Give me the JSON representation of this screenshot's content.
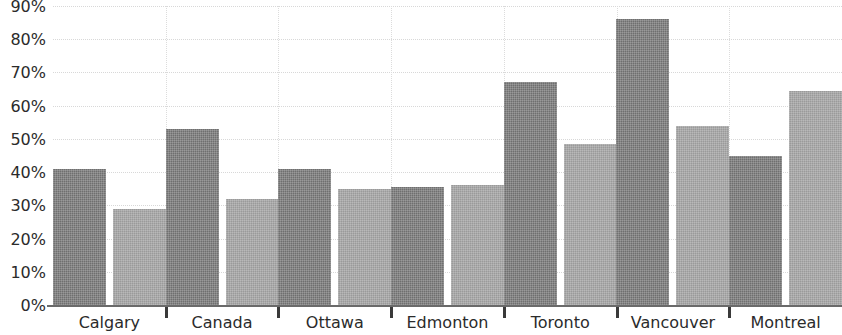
{
  "chart_data": {
    "type": "bar",
    "title": "",
    "subtitle": "",
    "xlabel": "",
    "ylabel": "",
    "categories": [
      "Calgary",
      "Canada",
      "Ottawa",
      "Edmonton",
      "Toronto",
      "Vancouver",
      "Montreal"
    ],
    "series": [
      {
        "name": "Series 1",
        "color": "#6f6f6f",
        "values": [
          41,
          53,
          41,
          35.5,
          67,
          86,
          45
        ]
      },
      {
        "name": "Series 2",
        "color": "#9a9a9a",
        "values": [
          29,
          32,
          35,
          36,
          48.5,
          54,
          64.5
        ]
      }
    ],
    "ylim": [
      0,
      90
    ],
    "ytick_values": [
      0,
      10,
      20,
      30,
      40,
      50,
      60,
      70,
      80,
      90
    ],
    "ytick_labels": [
      "0%",
      "10%",
      "20%",
      "30%",
      "40%",
      "50%",
      "60%",
      "70%",
      "80%",
      "90%"
    ],
    "grid": true,
    "grid_axis": "both",
    "legend": false,
    "legend_position": "none",
    "value_format": "percent"
  },
  "axis": {
    "y_axis_name": "y-axis",
    "x_axis_name": "x-axis"
  },
  "colors": {
    "series_a": "#6f6f6f",
    "series_b": "#9a9a9a",
    "gridline": "#d8d8d8",
    "axis_line": "#6a6a6a",
    "text": "#2b2b2b",
    "background": "#ffffff"
  }
}
